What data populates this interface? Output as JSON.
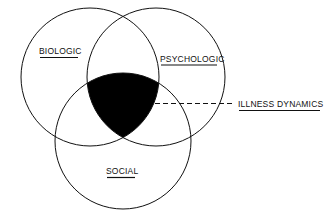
{
  "diagram": {
    "type": "venn",
    "sets": [
      {
        "id": "biologic",
        "label": "BIOLOGIC"
      },
      {
        "id": "psychologic",
        "label": "PSYCHOLOGIC"
      },
      {
        "id": "social",
        "label": "SOCIAL"
      }
    ],
    "intersection": {
      "label": "ILLNESS DYNAMICS",
      "fill": "#000000"
    },
    "colors": {
      "stroke": "#111111",
      "background": "#ffffff"
    }
  }
}
